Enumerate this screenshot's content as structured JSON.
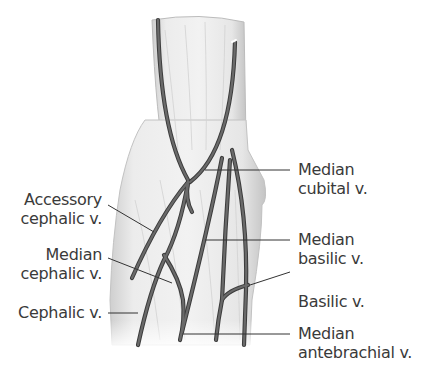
{
  "figure": {
    "colors": {
      "vein": "#5a5a5a",
      "vein_edge": "#3c3c3c",
      "skin": "#e9e9e9",
      "skin_shadow": "#c9c9c9",
      "leader": "#333333",
      "text": "#3a3a3a"
    }
  },
  "labels": {
    "left": [
      {
        "id": "accessory-cephalic",
        "line1": "Accessory",
        "line2": "cephalic v."
      },
      {
        "id": "median-cephalic",
        "line1": "Median",
        "line2": "cephalic v."
      },
      {
        "id": "cephalic",
        "line1": "Cephalic v.",
        "line2": ""
      }
    ],
    "right": [
      {
        "id": "median-cubital",
        "line1": "Median",
        "line2": "cubital v."
      },
      {
        "id": "median-basilic",
        "line1": "Median",
        "line2": "basilic v."
      },
      {
        "id": "basilic",
        "line1": "Basilic v.",
        "line2": ""
      },
      {
        "id": "median-antebrachial",
        "line1": "Median",
        "line2": "antebrachial v."
      }
    ]
  }
}
